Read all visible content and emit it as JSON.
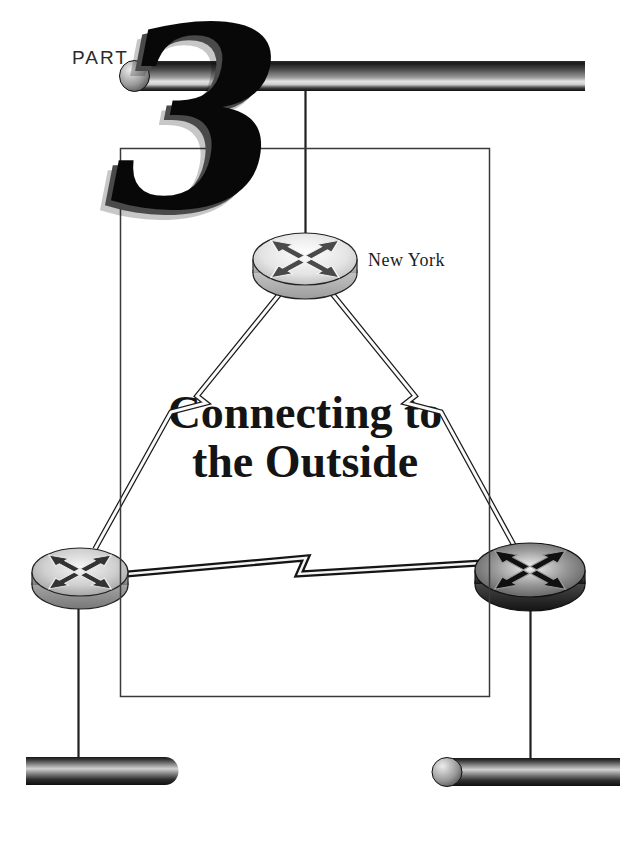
{
  "page": {
    "background": "#ffffff",
    "kind": "book-part-divider"
  },
  "part": {
    "label": "PART",
    "number": "3"
  },
  "title": {
    "line1": "Connecting to",
    "line2": "the Outside"
  },
  "diagram": {
    "router_top_label": "New York",
    "nodes": [
      {
        "id": "new-york-router",
        "type": "router",
        "icon": "router-four-arrows-icon",
        "label": "New York",
        "shade": "light"
      },
      {
        "id": "left-router",
        "type": "router",
        "icon": "router-four-arrows-icon",
        "label": "",
        "shade": "medium"
      },
      {
        "id": "right-router",
        "type": "router",
        "icon": "router-four-arrows-icon",
        "label": "",
        "shade": "dark"
      }
    ],
    "segments": [
      {
        "id": "top-backbone",
        "type": "ethernet-pipe",
        "position": "top"
      },
      {
        "id": "bottom-left-segment",
        "type": "ethernet-pipe",
        "position": "bottom-left"
      },
      {
        "id": "bottom-right-segment",
        "type": "ethernet-pipe",
        "position": "bottom-right"
      }
    ],
    "links": [
      {
        "from": "top-backbone",
        "to": "new-york-router",
        "type": "straight-drop"
      },
      {
        "from": "new-york-router",
        "to": "left-router",
        "type": "serial-lightning"
      },
      {
        "from": "new-york-router",
        "to": "right-router",
        "type": "serial-lightning"
      },
      {
        "from": "left-router",
        "to": "right-router",
        "type": "serial-lightning"
      },
      {
        "from": "left-router",
        "to": "bottom-left-segment",
        "type": "straight-drop"
      },
      {
        "from": "right-router",
        "to": "bottom-right-segment",
        "type": "straight-drop"
      }
    ]
  },
  "colors": {
    "ink": "#1a1a1a",
    "frame": "#3a3a3a",
    "pipe_highlight": "#e3e3e3",
    "numeral_shadow": "#4a4a4a",
    "text": "#141414"
  }
}
